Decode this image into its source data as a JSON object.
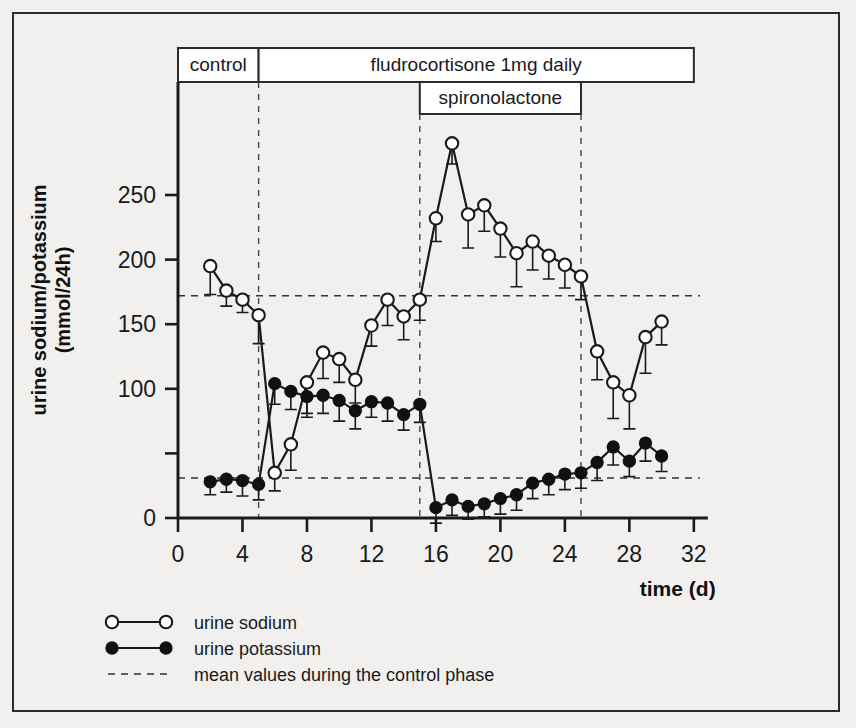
{
  "figure": {
    "y_axis_title_line1": "urine sodium/potassium",
    "y_axis_title_line2": "(mmol/24h)",
    "x_axis_title": "time (d)"
  },
  "phase_bars": [
    {
      "label": "control",
      "start_day": 0,
      "end_day": 5
    },
    {
      "label": "fludrocortisone 1mg daily",
      "start_day": 5,
      "end_day": 32
    },
    {
      "label": "spironolactone",
      "start_day": 15,
      "end_day": 25
    }
  ],
  "legend": {
    "items": [
      {
        "marker": "open-circle-line",
        "label": "urine sodium"
      },
      {
        "marker": "filled-circle-line",
        "label": "urine potassium"
      },
      {
        "marker": "dashed-line",
        "label": "mean values during the control phase"
      }
    ]
  },
  "chart_data": {
    "type": "line",
    "title": "",
    "xlabel": "time (d)",
    "ylabel": "urine sodium/potassium (mmol/24h)",
    "xlim": [
      0,
      32
    ],
    "ylim": [
      0,
      300
    ],
    "xticks": [
      0,
      4,
      8,
      12,
      16,
      20,
      24,
      28,
      32
    ],
    "yticks": [
      0,
      100,
      150,
      200,
      250
    ],
    "ytick_labels": [
      "0",
      "100",
      "150",
      "200",
      "250"
    ],
    "grid": false,
    "legend_position": "below-left",
    "x": [
      2,
      3,
      4,
      5,
      6,
      7,
      8,
      9,
      10,
      11,
      12,
      13,
      14,
      15,
      16,
      17,
      18,
      19,
      20,
      21,
      22,
      23,
      24,
      25,
      26,
      27,
      28,
      29,
      30
    ],
    "series": [
      {
        "name": "urine sodium",
        "marker": "open-circle",
        "values": [
          195,
          176,
          169,
          157,
          35,
          57,
          105,
          128,
          123,
          107,
          149,
          169,
          156,
          169,
          232,
          290,
          235,
          242,
          224,
          205,
          214,
          203,
          196,
          187,
          129,
          105,
          95,
          140,
          152
        ],
        "errors": [
          22,
          12,
          10,
          22,
          14,
          20,
          24,
          20,
          18,
          18,
          16,
          20,
          18,
          16,
          18,
          16,
          26,
          20,
          22,
          26,
          22,
          18,
          18,
          18,
          22,
          28,
          26,
          28,
          18
        ]
      },
      {
        "name": "urine potassium",
        "marker": "filled-circle",
        "values": [
          28,
          30,
          29,
          26,
          104,
          98,
          94,
          95,
          91,
          83,
          90,
          89,
          80,
          88,
          8,
          14,
          9,
          11,
          15,
          18,
          27,
          30,
          34,
          35,
          43,
          55,
          44,
          58,
          48
        ],
        "errors": [
          10,
          10,
          12,
          12,
          16,
          14,
          16,
          14,
          16,
          14,
          12,
          14,
          12,
          14,
          12,
          12,
          10,
          10,
          12,
          12,
          12,
          12,
          12,
          12,
          14,
          14,
          12,
          14,
          12
        ]
      }
    ],
    "annotations": [
      {
        "kind": "mean-line",
        "series": "urine sodium",
        "value": 172,
        "style": "dashed"
      },
      {
        "kind": "mean-line",
        "series": "urine potassium",
        "value": 31,
        "style": "dashed"
      },
      {
        "kind": "phase-divider",
        "day": 5,
        "style": "dashed"
      },
      {
        "kind": "phase-divider",
        "day": 15,
        "style": "dashed"
      },
      {
        "kind": "phase-divider",
        "day": 25,
        "style": "dashed"
      }
    ]
  }
}
